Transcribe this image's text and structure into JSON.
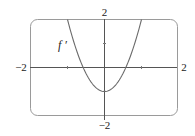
{
  "chart_data": {
    "type": "line",
    "title": "",
    "xlabel": "",
    "ylabel": "",
    "xlim": [
      -2,
      2
    ],
    "ylim": [
      -2,
      2
    ],
    "grid": false,
    "x_tick_labels": [
      "-2",
      "2"
    ],
    "y_tick_labels": [
      "2",
      "-2"
    ],
    "series": [
      {
        "name": "f'",
        "x": [
          -1.0,
          -0.8,
          -0.6,
          -0.4,
          -0.2,
          0,
          0.2,
          0.4,
          0.6,
          0.8,
          1.0
        ],
        "values": [
          2.0,
          0.92,
          0.08,
          -0.52,
          -0.88,
          -1.0,
          -0.88,
          -0.52,
          0.08,
          0.92,
          2.0
        ]
      }
    ],
    "annotations": [
      {
        "text": "f'",
        "x": -0.95,
        "y": 1.1
      }
    ]
  },
  "labels": {
    "x_min": "−2",
    "x_max": "2",
    "y_max": "2",
    "y_min": "−2",
    "curve": "f ′"
  }
}
